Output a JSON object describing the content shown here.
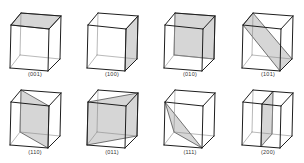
{
  "colors": {
    "edge": "#1e1e1e",
    "hidden_edge": "#8a8a8a",
    "plane_fill": "#d6d6d6",
    "background": "#ffffff"
  },
  "cube_geometry": {
    "FTL": [
      0,
      0
    ],
    "FTR": [
      38,
      4
    ],
    "FBL": [
      -1,
      43
    ],
    "FBR": [
      37,
      46
    ],
    "BTL": [
      10,
      -12
    ],
    "BTR": [
      50,
      -9
    ],
    "BBL": [
      9,
      30
    ],
    "BBR": [
      49,
      34
    ]
  },
  "cells": [
    {
      "label": "(001)",
      "origin": [
        11,
        25
      ],
      "label_pos": [
        35,
        74
      ],
      "plane": [
        "FTL",
        "FTR",
        "BTR",
        "BTL"
      ]
    },
    {
      "label": "(100)",
      "origin": [
        88,
        25
      ],
      "label_pos": [
        112,
        74
      ],
      "plane": [
        "FTR",
        "BTR",
        "BBR",
        "FBR"
      ]
    },
    {
      "label": "(010)",
      "origin": [
        165,
        25
      ],
      "label_pos": [
        190,
        74
      ],
      "plane": [
        "BTL",
        "BTR",
        "BBR",
        "BBL"
      ]
    },
    {
      "label": "(101)",
      "origin": [
        243,
        25
      ],
      "label_pos": [
        268,
        74
      ],
      "plane": [
        "FTL",
        "BTL",
        "BBR",
        "FBR"
      ]
    },
    {
      "label": "(110)",
      "origin": [
        11,
        102
      ],
      "label_pos": [
        35,
        152
      ],
      "plane": [
        "BTL",
        "FTR",
        "FBR",
        "BBL"
      ]
    },
    {
      "label": "(011)",
      "origin": [
        88,
        102
      ],
      "label_pos": [
        112,
        152
      ],
      "plane": [
        "FTL",
        "BTR",
        "BBR",
        "FBL"
      ]
    },
    {
      "label": "(111)",
      "origin": [
        165,
        102
      ],
      "label_pos": [
        190,
        152
      ],
      "plane": [
        "FTL",
        "FBR",
        "BBL"
      ]
    },
    {
      "label": "(200)",
      "origin": [
        243,
        102
      ],
      "label_pos": [
        268,
        152
      ],
      "plane": [
        "MFT",
        "MBT",
        "MBB",
        "MFB"
      ]
    }
  ]
}
